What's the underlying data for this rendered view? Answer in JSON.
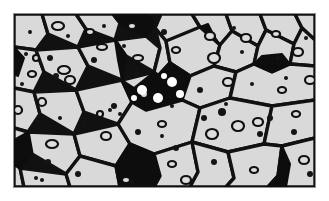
{
  "figure": {
    "kind": "micrograph-illustration",
    "caption": "",
    "title": "",
    "panel": {
      "x": 13,
      "y": 13,
      "width": 303,
      "height": 175,
      "border_color": "#8d8d8d",
      "border_width": 1
    }
  },
  "palette": {
    "page_background": "#ffffff",
    "grain_fill": "#d9d9d9",
    "grain_boundary": "#111111",
    "second_phase_fill": "#0d0d0d",
    "void_outline": "#111111",
    "void_fill": "#dedede",
    "white_inclusion": "#ffffff",
    "particle_fill": "#141414"
  },
  "chart_data": {
    "type": "diagram",
    "xlabel": "",
    "ylabel": "",
    "viewbox": [
      0,
      0,
      301,
      173
    ],
    "legend": [],
    "counts": {
      "grains": 38,
      "black_phase_regions": 9,
      "open_voids": 34,
      "solid_particles": 41,
      "white_inclusions": 6
    },
    "grains": [
      {
        "id": "g01",
        "points": "0,0 28,0 34,20 22,36 0,33"
      },
      {
        "id": "g02",
        "points": "28,0 62,0 72,15 64,33 34,20"
      },
      {
        "id": "g03",
        "points": "62,0 99,0 106,9 101,26 72,15"
      },
      {
        "id": "g04",
        "points": "99,0 131,0 140,8 132,22 106,9"
      },
      {
        "id": "g05",
        "points": "147,0 178,0 186,13 178,30 152,27 141,14"
      },
      {
        "id": "g06",
        "points": "178,0 212,0 218,17 206,31 186,13"
      },
      {
        "id": "g07",
        "points": "212,0 246,0 252,16 244,32 218,17"
      },
      {
        "id": "g08",
        "points": "246,0 281,0 288,14 280,30 252,16"
      },
      {
        "id": "g09",
        "points": "281,0 301,0 301,26 288,14"
      },
      {
        "id": "g10",
        "points": "0,33 22,36 30,58 20,78 0,74"
      },
      {
        "id": "g11",
        "points": "22,36 64,33 74,52 62,76 30,58"
      },
      {
        "id": "g12",
        "points": "64,33 101,26 112,42 108,66 74,52"
      },
      {
        "id": "g13",
        "points": "101,26 132,22 146,34 140,58 112,42"
      },
      {
        "id": "g14",
        "points": "141,14 152,27 156,49 144,62 140,58 146,34"
      },
      {
        "id": "g15",
        "points": "152,27 186,13 206,31 200,52 176,62 156,49"
      },
      {
        "id": "g16",
        "points": "206,31 218,17 244,32 240,50 222,58 200,52"
      },
      {
        "id": "g17",
        "points": "244,32 252,16 280,30 276,50 258,58 240,50"
      },
      {
        "id": "g18",
        "points": "280,30 288,14 301,26 301,52 276,50"
      },
      {
        "id": "g19",
        "points": "0,74 20,78 26,100 14,118 0,114"
      },
      {
        "id": "g20",
        "points": "20,78 62,76 70,98 60,120 26,100"
      },
      {
        "id": "g21",
        "points": "62,76 108,66 118,88 104,110 70,98"
      },
      {
        "id": "g22",
        "points": "108,66 140,58 144,62 156,49 176,62 168,86 132,96 118,88"
      },
      {
        "id": "g23",
        "points": "176,62 200,52 222,58 216,84 186,94 168,86"
      },
      {
        "id": "g24",
        "points": "222,58 240,50 258,58 276,50 301,52 301,86 258,92 216,84"
      },
      {
        "id": "g25",
        "points": "0,114 14,118 18,140 6,154 0,150"
      },
      {
        "id": "g26",
        "points": "14,118 60,120 66,142 52,160 18,140"
      },
      {
        "id": "g27",
        "points": "60,120 104,110 116,130 102,152 66,142"
      },
      {
        "id": "g28",
        "points": "104,110 118,88 132,96 168,86 186,94 178,128 140,140 116,130"
      },
      {
        "id": "g29",
        "points": "186,94 216,84 258,92 250,130 214,138 178,128"
      },
      {
        "id": "g30",
        "points": "258,92 301,86 301,124 268,132 250,130"
      },
      {
        "id": "g31",
        "points": "0,150 6,154 10,173 0,173"
      },
      {
        "id": "g32",
        "points": "6,154 52,160 56,173 10,173"
      },
      {
        "id": "g33",
        "points": "52,160 66,142 102,152 106,173 56,173"
      },
      {
        "id": "g34",
        "points": "102,152 116,130 140,140 146,162 140,173 106,173"
      },
      {
        "id": "g35",
        "points": "140,140 178,128 184,158 176,173 140,173 146,162"
      },
      {
        "id": "g36",
        "points": "178,128 214,138 220,164 212,173 176,173 184,158"
      },
      {
        "id": "g37",
        "points": "214,138 250,130 268,132 264,162 254,173 212,173 220,164"
      },
      {
        "id": "g38",
        "points": "268,132 301,124 301,173 254,173 264,162"
      }
    ],
    "second_phase_regions": [
      {
        "id": "bp1",
        "points": "106,9 132,22 140,8 131,0 99,0",
        "note": "top wedge"
      },
      {
        "id": "bp2",
        "points": "101,26 112,42 108,66 104,46",
        "note": "thin spur"
      },
      {
        "id": "bp3",
        "points": "108,66 118,88 132,96 168,86 176,62 156,49 144,62 140,58 120,74",
        "note": "large central wedge"
      },
      {
        "id": "bp4",
        "points": "240,50 258,58 276,50 268,40 248,42",
        "note": "right diamond"
      },
      {
        "id": "bp5",
        "points": "0,150 6,154 18,140 14,118 0,126",
        "note": "left edge patch"
      },
      {
        "id": "bp6",
        "points": "102,152 116,130 140,140 146,162 140,173 106,173",
        "note": "lower mid dark"
      },
      {
        "id": "bp7",
        "points": "254,173 264,162 268,132 276,150 272,173",
        "note": "lower right dark"
      },
      {
        "id": "bp8",
        "points": "0,33 10,44 4,62 0,60",
        "note": "left sliver"
      },
      {
        "id": "bp9",
        "points": "186,13 206,31 200,22 194,10",
        "note": "small upper node"
      }
    ],
    "open_voids": [
      {
        "cx": 44,
        "cy": 12,
        "rx": 6,
        "ry": 4
      },
      {
        "cx": 88,
        "cy": 33,
        "rx": 5,
        "ry": 3
      },
      {
        "cx": 50,
        "cy": 56,
        "rx": 6,
        "ry": 4
      },
      {
        "cx": 56,
        "cy": 66,
        "rx": 5,
        "ry": 4
      },
      {
        "cx": 18,
        "cy": 60,
        "rx": 4,
        "ry": 3
      },
      {
        "cx": 28,
        "cy": 88,
        "rx": 4,
        "ry": 4
      },
      {
        "cx": 124,
        "cy": 44,
        "rx": 5,
        "ry": 3
      },
      {
        "cx": 130,
        "cy": 80,
        "rx": 4,
        "ry": 4
      },
      {
        "cx": 162,
        "cy": 36,
        "rx": 4,
        "ry": 3
      },
      {
        "cx": 196,
        "cy": 22,
        "rx": 5,
        "ry": 4
      },
      {
        "cx": 200,
        "cy": 44,
        "rx": 6,
        "ry": 5
      },
      {
        "cx": 214,
        "cy": 68,
        "rx": 5,
        "ry": 4
      },
      {
        "cx": 232,
        "cy": 24,
        "rx": 5,
        "ry": 4
      },
      {
        "cx": 262,
        "cy": 20,
        "rx": 4,
        "ry": 3
      },
      {
        "cx": 284,
        "cy": 38,
        "rx": 5,
        "ry": 4
      },
      {
        "cx": 296,
        "cy": 66,
        "rx": 5,
        "ry": 4
      },
      {
        "cx": 4,
        "cy": 96,
        "rx": 4,
        "ry": 4
      },
      {
        "cx": 38,
        "cy": 130,
        "rx": 6,
        "ry": 4
      },
      {
        "cx": 92,
        "cy": 122,
        "rx": 5,
        "ry": 4
      },
      {
        "cx": 148,
        "cy": 110,
        "rx": 4,
        "ry": 3
      },
      {
        "cx": 158,
        "cy": 150,
        "rx": 4,
        "ry": 3
      },
      {
        "cx": 172,
        "cy": 166,
        "rx": 5,
        "ry": 4
      },
      {
        "cx": 198,
        "cy": 120,
        "rx": 6,
        "ry": 5
      },
      {
        "cx": 224,
        "cy": 112,
        "rx": 6,
        "ry": 5
      },
      {
        "cx": 244,
        "cy": 108,
        "rx": 5,
        "ry": 4
      },
      {
        "cx": 282,
        "cy": 100,
        "rx": 4,
        "ry": 3
      },
      {
        "cx": 290,
        "cy": 146,
        "rx": 5,
        "ry": 4
      },
      {
        "cx": 112,
        "cy": 166,
        "rx": 4,
        "ry": 3
      },
      {
        "cx": 76,
        "cy": 18,
        "rx": 4,
        "ry": 3
      },
      {
        "cx": 22,
        "cy": 44,
        "rx": 3,
        "ry": 3
      },
      {
        "cx": 86,
        "cy": 100,
        "rx": 3,
        "ry": 3
      },
      {
        "cx": 240,
        "cy": 156,
        "rx": 4,
        "ry": 3
      },
      {
        "cx": 268,
        "cy": 76,
        "rx": 4,
        "ry": 3
      },
      {
        "cx": 118,
        "cy": 12,
        "rx": 4,
        "ry": 3
      }
    ],
    "solid_particles": [
      {
        "cx": 16,
        "cy": 18,
        "r": 2
      },
      {
        "cx": 12,
        "cy": 40,
        "r": 2
      },
      {
        "cx": 36,
        "cy": 44,
        "r": 3
      },
      {
        "cx": 42,
        "cy": 62,
        "r": 3
      },
      {
        "cx": 8,
        "cy": 70,
        "r": 2
      },
      {
        "cx": 24,
        "cy": 108,
        "r": 2
      },
      {
        "cx": 46,
        "cy": 104,
        "r": 2
      },
      {
        "cx": 34,
        "cy": 148,
        "r": 3
      },
      {
        "cx": 22,
        "cy": 164,
        "r": 2
      },
      {
        "cx": 28,
        "cy": 166,
        "r": 2
      },
      {
        "cx": 64,
        "cy": 160,
        "r": 3
      },
      {
        "cx": 80,
        "cy": 46,
        "r": 3
      },
      {
        "cx": 90,
        "cy": 12,
        "r": 2
      },
      {
        "cx": 110,
        "cy": 32,
        "r": 2
      },
      {
        "cx": 122,
        "cy": 60,
        "r": 3
      },
      {
        "cx": 100,
        "cy": 92,
        "r": 3
      },
      {
        "cx": 96,
        "cy": 96,
        "r": 2
      },
      {
        "cx": 106,
        "cy": 100,
        "r": 2
      },
      {
        "cx": 124,
        "cy": 118,
        "r": 3
      },
      {
        "cx": 118,
        "cy": 168,
        "r": 2
      },
      {
        "cx": 150,
        "cy": 18,
        "r": 3
      },
      {
        "cx": 158,
        "cy": 92,
        "r": 2
      },
      {
        "cx": 148,
        "cy": 122,
        "r": 2
      },
      {
        "cx": 162,
        "cy": 134,
        "r": 3
      },
      {
        "cx": 186,
        "cy": 76,
        "r": 3
      },
      {
        "cx": 190,
        "cy": 104,
        "r": 3
      },
      {
        "cx": 208,
        "cy": 98,
        "r": 4
      },
      {
        "cx": 200,
        "cy": 148,
        "r": 3
      },
      {
        "cx": 212,
        "cy": 90,
        "r": 2
      },
      {
        "cx": 228,
        "cy": 38,
        "r": 2
      },
      {
        "cx": 220,
        "cy": 14,
        "r": 2
      },
      {
        "cx": 238,
        "cy": 70,
        "r": 2
      },
      {
        "cx": 246,
        "cy": 120,
        "r": 3
      },
      {
        "cx": 256,
        "cy": 104,
        "r": 3
      },
      {
        "cx": 264,
        "cy": 44,
        "r": 2
      },
      {
        "cx": 272,
        "cy": 64,
        "r": 2
      },
      {
        "cx": 280,
        "cy": 118,
        "r": 3
      },
      {
        "cx": 292,
        "cy": 24,
        "r": 2
      },
      {
        "cx": 296,
        "cy": 160,
        "r": 3
      },
      {
        "cx": 54,
        "cy": 22,
        "r": 2
      },
      {
        "cx": 70,
        "cy": 108,
        "r": 2
      }
    ],
    "white_inclusions": [
      {
        "cx": 128,
        "cy": 76,
        "r": 5
      },
      {
        "cx": 144,
        "cy": 84,
        "r": 5
      },
      {
        "cx": 158,
        "cy": 68,
        "r": 5
      },
      {
        "cx": 166,
        "cy": 80,
        "r": 4
      },
      {
        "cx": 120,
        "cy": 84,
        "r": 3
      },
      {
        "cx": 150,
        "cy": 62,
        "r": 3
      }
    ]
  }
}
